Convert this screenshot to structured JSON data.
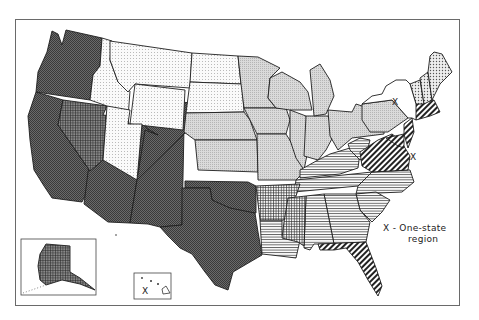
{
  "figure": {
    "type": "choropleth map",
    "legend": {
      "line1": "X - One-state",
      "line2": "region"
    }
  },
  "markers": {
    "new_york": "X",
    "delaware": "X",
    "hawaii": "X"
  },
  "patterns": {
    "west_dark": {
      "name": "dense cross-hatch dark",
      "fill": "#5c5c5c"
    },
    "nevada": {
      "name": "dark grid",
      "fill": "#474747"
    },
    "mountain_dots": {
      "name": "sparse dots",
      "fill": "#ececec"
    },
    "midwest_gray": {
      "name": "light gray stipple",
      "fill": "#cfcfcf"
    },
    "south_horizontal": {
      "name": "horizontal lines",
      "fill": "#ffffff"
    },
    "south_central_grid": {
      "name": "fine grid",
      "fill": "#ffffff"
    },
    "atlantic_diagonal": {
      "name": "diagonal hatch",
      "fill": "#ffffff"
    },
    "new_england_dots": {
      "name": "dotted",
      "fill": "#e6e6e6"
    },
    "new_york": {
      "name": "blank",
      "fill": "#ffffff"
    }
  },
  "regions": [
    {
      "id": "pacific_southwest",
      "states": [
        "WA",
        "OR",
        "CA",
        "AZ",
        "NM",
        "CO",
        "OK",
        "TX"
      ],
      "pattern": "west_dark"
    },
    {
      "id": "nevada",
      "states": [
        "NV",
        "AK"
      ],
      "pattern": "nevada"
    },
    {
      "id": "mountain_plains",
      "states": [
        "MT",
        "ID",
        "WY",
        "UT",
        "ND",
        "SD"
      ],
      "pattern": "mountain_dots"
    },
    {
      "id": "midwest",
      "states": [
        "NE",
        "KS",
        "MN",
        "IA",
        "MO",
        "WI",
        "IL",
        "MI",
        "IN",
        "OH",
        "PA"
      ],
      "pattern": "midwest_gray"
    },
    {
      "id": "southeast",
      "states": [
        "KY",
        "TN",
        "NC",
        "SC",
        "GA",
        "AL",
        "LA",
        "WV"
      ],
      "pattern": "south_horizontal"
    },
    {
      "id": "south_central",
      "states": [
        "AR",
        "MS"
      ],
      "pattern": "south_central_grid"
    },
    {
      "id": "atlantic",
      "states": [
        "VA",
        "MD",
        "NJ",
        "MA",
        "CT",
        "RI",
        "FL"
      ],
      "pattern": "atlantic_diagonal"
    },
    {
      "id": "northern_new_england",
      "states": [
        "ME",
        "NH",
        "VT"
      ],
      "pattern": "new_england_dots"
    },
    {
      "id": "one_state",
      "states": [
        "NY",
        "DE",
        "HI"
      ],
      "pattern": "new_york"
    }
  ]
}
